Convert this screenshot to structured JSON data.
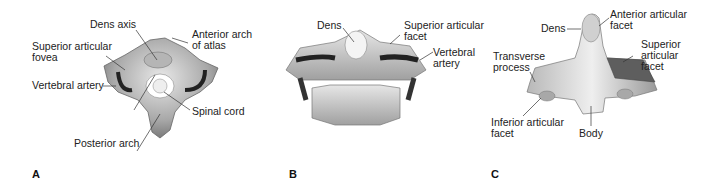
{
  "figure": {
    "panels": [
      {
        "letter": "A",
        "view": "atlas superior view",
        "labels": {
          "dens_axis": "Dens axis",
          "anterior_arch": "Anterior arch\nof atlas",
          "superior_fovea": "Superior articular\nfovea",
          "vertebral_artery": "Vertebral artery",
          "spinal_cord": "Spinal cord",
          "posterior_arch": "Posterior arch"
        }
      },
      {
        "letter": "B",
        "view": "atlas-axis posterior view",
        "labels": {
          "dens": "Dens",
          "superior_facet": "Superior articular\nfacet",
          "vertebral_artery": "Vertebral\nartery"
        }
      },
      {
        "letter": "C",
        "view": "axis anterior view",
        "labels": {
          "dens": "Dens",
          "anterior_facet": "Anterior articular\nfacet",
          "transverse_process": "Transverse\nprocess",
          "superior_facet": "Superior\narticular\nfacet",
          "inferior_facet": "Inferior articular\nfacet",
          "body": "Body"
        }
      }
    ]
  }
}
